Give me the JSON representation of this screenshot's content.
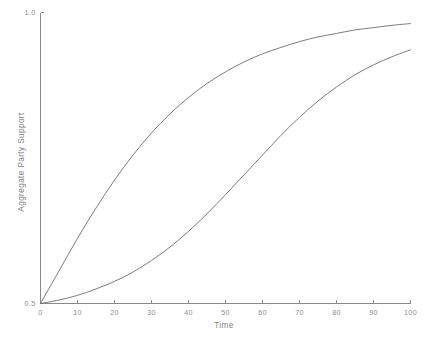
{
  "chart_data": {
    "type": "line",
    "title": "",
    "xlabel": "Time",
    "ylabel": "Aggregate Party Support",
    "xlim": [
      0,
      100
    ],
    "ylim": [
      0.5,
      1.0
    ],
    "grid": false,
    "legend": false,
    "xticks": [
      0,
      10,
      20,
      30,
      40,
      50,
      60,
      70,
      80,
      90,
      100
    ],
    "xtick_labels": [
      "0",
      "10",
      "20",
      "30",
      "40",
      "50",
      "60",
      "70",
      "80",
      "90",
      "100"
    ],
    "yticks": [
      0.5,
      1.0
    ],
    "ytick_labels": [
      "0.5",
      "1.0"
    ],
    "line_color": "#6e6e72",
    "axis_color": "#8a8a8a",
    "text_color": "#8d8d92",
    "background": "#ffffff",
    "x": [
      0,
      5,
      10,
      15,
      20,
      25,
      30,
      35,
      40,
      45,
      50,
      55,
      60,
      65,
      70,
      75,
      80,
      85,
      90,
      95,
      100
    ],
    "series": [
      {
        "name": "fast-adopting party",
        "values": [
          0.5,
          0.556,
          0.612,
          0.664,
          0.712,
          0.755,
          0.793,
          0.826,
          0.854,
          0.878,
          0.898,
          0.915,
          0.929,
          0.94,
          0.95,
          0.958,
          0.964,
          0.97,
          0.974,
          0.978,
          0.981
        ]
      },
      {
        "name": "slow-adopting party",
        "values": [
          0.5,
          0.506,
          0.514,
          0.525,
          0.538,
          0.554,
          0.574,
          0.597,
          0.624,
          0.654,
          0.687,
          0.721,
          0.755,
          0.789,
          0.82,
          0.848,
          0.872,
          0.893,
          0.91,
          0.924,
          0.936
        ]
      }
    ]
  }
}
